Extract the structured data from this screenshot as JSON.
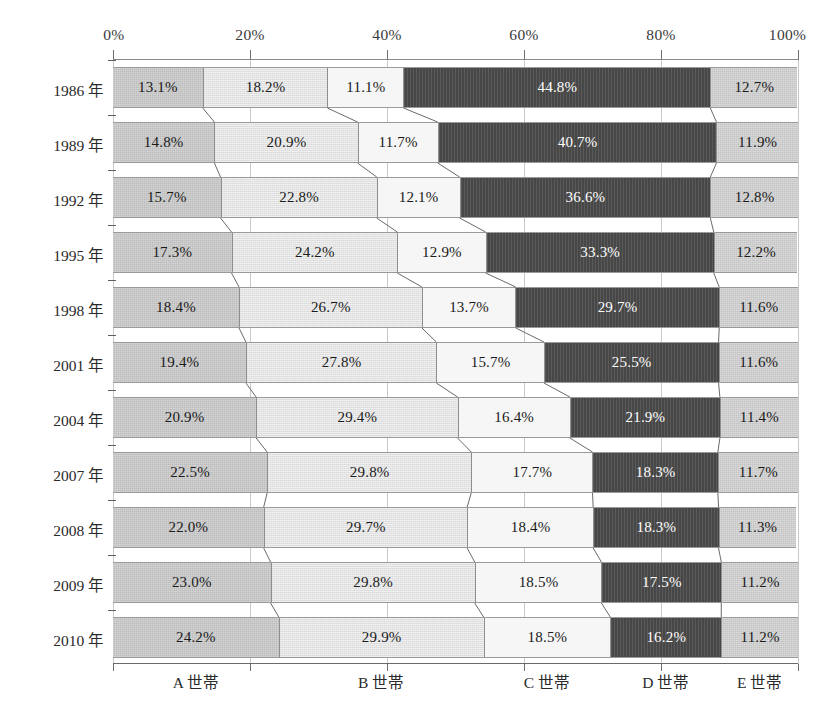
{
  "chart_data": {
    "type": "bar",
    "subtype": "horizontal-stacked-100-percent",
    "title": "",
    "xlabel": "",
    "ylabel": "",
    "xlim": [
      0,
      100
    ],
    "xunit": "%",
    "grid": true,
    "legend_position": "bottom",
    "orientation": "horizontal",
    "xticks": [
      "0%",
      "20%",
      "40%",
      "60%",
      "80%",
      "100%"
    ],
    "xtick_values": [
      0,
      20,
      40,
      60,
      80,
      100
    ],
    "categories": [
      "1986 年",
      "1989 年",
      "1992 年",
      "1995 年",
      "1998 年",
      "2001 年",
      "2004 年",
      "2007 年",
      "2008 年",
      "2009 年",
      "2010 年"
    ],
    "legend": [
      "A 世帯",
      "B 世帯",
      "C 世帯",
      "D 世帯",
      "E 世帯"
    ],
    "series": [
      {
        "name": "A 世帯",
        "color": "#bcbcbc",
        "values": [
          13.1,
          14.8,
          15.7,
          17.3,
          18.4,
          19.4,
          20.9,
          22.5,
          22.0,
          23.0,
          24.2
        ]
      },
      {
        "name": "B 世帯",
        "color": "#e2e2e2",
        "values": [
          18.2,
          20.9,
          22.8,
          24.2,
          26.7,
          27.8,
          29.4,
          29.8,
          29.7,
          29.8,
          29.9
        ]
      },
      {
        "name": "C 世帯",
        "color": "#f6f6f6",
        "values": [
          11.1,
          11.7,
          12.1,
          12.9,
          13.7,
          15.7,
          16.4,
          17.7,
          18.4,
          18.5,
          18.5
        ]
      },
      {
        "name": "D 世帯",
        "color": "#474747",
        "values": [
          44.8,
          40.7,
          36.6,
          33.3,
          29.7,
          25.5,
          21.9,
          18.3,
          18.3,
          17.5,
          16.2
        ]
      },
      {
        "name": "E 世帯",
        "color": "#c3c3c3",
        "values": [
          12.7,
          11.9,
          12.8,
          12.2,
          11.6,
          11.6,
          11.4,
          11.7,
          11.3,
          11.2,
          11.2
        ]
      }
    ],
    "data_labels": [
      [
        "13.1%",
        "18.2%",
        "11.1%",
        "44.8%",
        "12.7%"
      ],
      [
        "14.8%",
        "20.9%",
        "11.7%",
        "40.7%",
        "11.9%"
      ],
      [
        "15.7%",
        "22.8%",
        "12.1%",
        "36.6%",
        "12.8%"
      ],
      [
        "17.3%",
        "24.2%",
        "12.9%",
        "33.3%",
        "12.2%"
      ],
      [
        "18.4%",
        "26.7%",
        "13.7%",
        "29.7%",
        "11.6%"
      ],
      [
        "19.4%",
        "27.8%",
        "15.7%",
        "25.5%",
        "11.6%"
      ],
      [
        "20.9%",
        "29.4%",
        "16.4%",
        "21.9%",
        "11.4%"
      ],
      [
        "22.5%",
        "29.8%",
        "17.7%",
        "18.3%",
        "11.7%"
      ],
      [
        "22.0%",
        "29.7%",
        "18.4%",
        "18.3%",
        "11.3%"
      ],
      [
        "23.0%",
        "29.8%",
        "18.5%",
        "17.5%",
        "11.2%"
      ],
      [
        "24.2%",
        "29.9%",
        "18.5%",
        "16.2%",
        "11.2%"
      ]
    ]
  },
  "colors": {
    "axis": "#6f6f6f",
    "gridline": "#c9c9c9",
    "segment_border": "#8f8f8f",
    "connector": "#6a6a6a",
    "text": "#2a2a2a",
    "label_light": "#1a1a1a",
    "label_dark": "#ffffff",
    "background": "#ffffff"
  }
}
